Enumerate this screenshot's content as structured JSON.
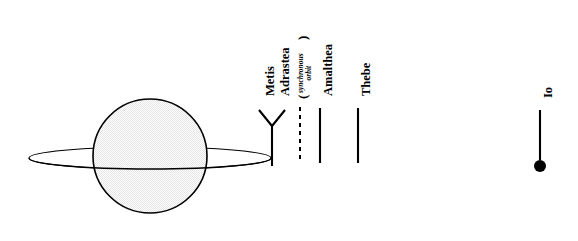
{
  "figure": {
    "background_color": "#ffffff",
    "ink_color": "#000000",
    "width": 578,
    "height": 241
  },
  "planet": {
    "name": "Jupiter",
    "center_x": 150,
    "center_y": 156,
    "radius": 57,
    "outline_color": "#000000",
    "band_colors": [
      "#c9c9c9",
      "#b4b4b4",
      "#9a9a9a",
      "#e2e2e2",
      "#8f8f8f",
      "#d6d6d6",
      "#bdbdbd",
      "#cfcfcf"
    ]
  },
  "ring": {
    "name": "Jupiter ring",
    "center_x": 150,
    "center_y": 158,
    "radius_x": 121,
    "radius_y": 11,
    "stroke_color": "#000000"
  },
  "markers": [
    {
      "id": "metis-adrastea",
      "kind": "fork",
      "style": "solid",
      "x": 272,
      "line_top": 126,
      "line_bottom": 166,
      "fork_span": 13,
      "fork_top": 110,
      "labels": [
        {
          "text": "Metis",
          "x": 263,
          "y": 96
        },
        {
          "text": "Adrastea",
          "x": 277,
          "y": 96
        }
      ]
    },
    {
      "id": "synchronous-orbit",
      "kind": "line",
      "style": "dashed",
      "x": 300,
      "line_top": 107,
      "line_bottom": 163,
      "labels": []
    },
    {
      "id": "amalthea",
      "kind": "line",
      "style": "solid",
      "x": 320,
      "line_top": 108,
      "line_bottom": 163,
      "labels": [
        {
          "text": "Amalthea",
          "x": 320,
          "y": 96
        }
      ]
    },
    {
      "id": "thebe",
      "kind": "line",
      "style": "solid",
      "x": 358,
      "line_top": 108,
      "line_bottom": 163,
      "labels": [
        {
          "text": "Thebe",
          "x": 358,
          "y": 96
        }
      ]
    },
    {
      "id": "io",
      "kind": "line-with-dot",
      "style": "solid",
      "x": 540,
      "line_top": 110,
      "line_bottom": 160,
      "dot_radius": 6,
      "dot_y": 166,
      "labels": [
        {
          "text": "Io",
          "x": 540,
          "y": 98
        }
      ]
    }
  ],
  "labels": {
    "metis": "Metis",
    "adrastea": "Adrastea",
    "synchronous_note_line1": "synchronous",
    "synchronous_note_line2": "orbit",
    "paren_open": "(",
    "paren_close": ")",
    "amalthea": "Amalthea",
    "thebe": "Thebe",
    "io": "Io"
  }
}
